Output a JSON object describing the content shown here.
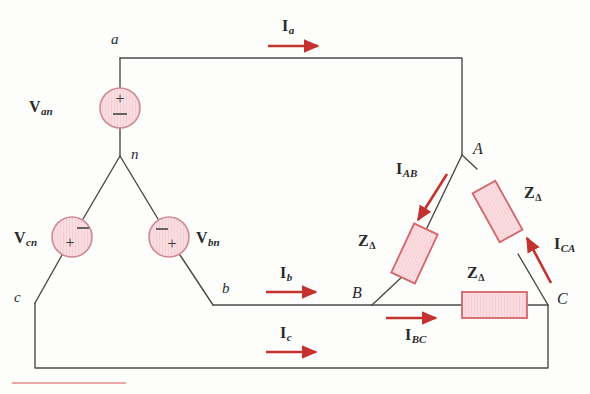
{
  "figure": {
    "colors": {
      "background": "#fdfdfc",
      "wire": "#4a4a4a",
      "accent_red": "#c4322f",
      "source_fill": "#f7d9dd",
      "source_stroke": "#d08b96",
      "impedance_fill": "#fbdde1",
      "impedance_stroke": "#d4666a",
      "text": "#2a2a2a"
    }
  },
  "nodes": {
    "a": "a",
    "b": "b",
    "c": "c",
    "n": "n",
    "A": "A",
    "B": "B",
    "C": "C"
  },
  "sources": [
    {
      "id": "van",
      "label_v": "V",
      "label_sub": "an",
      "plus": "+",
      "minus": "−",
      "orientation": "vertical",
      "plus_position": "top"
    },
    {
      "id": "vbn",
      "label_v": "V",
      "label_sub": "bn",
      "plus": "+",
      "minus": "−",
      "orientation": "diagonal-down-right",
      "plus_position": "lower-right"
    },
    {
      "id": "vcn",
      "label_v": "V",
      "label_sub": "cn",
      "plus": "+",
      "minus": "−",
      "orientation": "diagonal-down-left",
      "plus_position": "lower-left"
    }
  ],
  "impedances": [
    {
      "id": "z-ab",
      "label_z": "Z",
      "label_sub": "Δ",
      "branch": "A-B"
    },
    {
      "id": "z-ca",
      "label_z": "Z",
      "label_sub": "Δ",
      "branch": "C-A"
    },
    {
      "id": "z-bc",
      "label_z": "Z",
      "label_sub": "Δ",
      "branch": "B-C"
    }
  ],
  "line_currents": [
    {
      "id": "ia",
      "label_i": "I",
      "label_sub": "a",
      "direction": "right"
    },
    {
      "id": "ib",
      "label_i": "I",
      "label_sub": "b",
      "direction": "right"
    },
    {
      "id": "ic",
      "label_i": "I",
      "label_sub": "c",
      "direction": "right"
    }
  ],
  "phase_currents": [
    {
      "id": "iab",
      "label_i": "I",
      "label_sub": "AB",
      "direction": "down-left"
    },
    {
      "id": "ibc",
      "label_i": "I",
      "label_sub": "BC",
      "direction": "right"
    },
    {
      "id": "ica",
      "label_i": "I",
      "label_sub": "CA",
      "direction": "up-left"
    }
  ]
}
